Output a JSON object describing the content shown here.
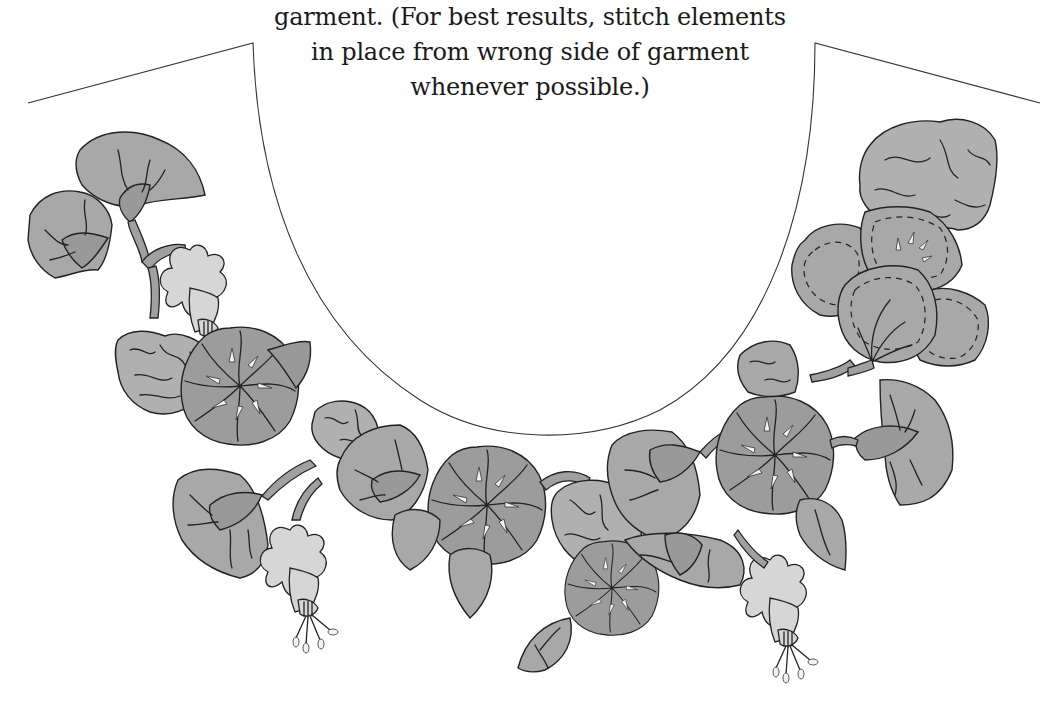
{
  "caption": {
    "lines": [
      "garment. (For best results, stitch elements",
      "in place from wrong side of garment",
      "whenever possible.)"
    ]
  },
  "illustration": {
    "subject": "neckline appliqué pattern",
    "elements": [
      "morning-glory-flowers",
      "fuchsia-blossoms",
      "leaves",
      "ruffled-petals",
      "scalloped-leaves",
      "twisted-vine"
    ],
    "colors": {
      "leaf": "#a8a8a8",
      "flower": "#9c9c9c",
      "fuchsia": "#d6d6d6",
      "outline": "#222222",
      "neckline": "#333333",
      "background": "#ffffff"
    }
  }
}
